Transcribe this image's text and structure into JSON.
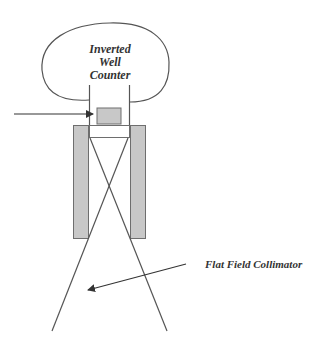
{
  "diagram": {
    "labels": {
      "counter_line1": "Inverted",
      "counter_line2": "Well",
      "counter_line3": "Counter",
      "collimator": "Flat Field Collimator"
    },
    "colors": {
      "stroke": "#555555",
      "shield_fill": "#c8c8c8",
      "shield_stroke": "#6e6e6e",
      "background": "#ffffff",
      "text": "#333333"
    }
  }
}
